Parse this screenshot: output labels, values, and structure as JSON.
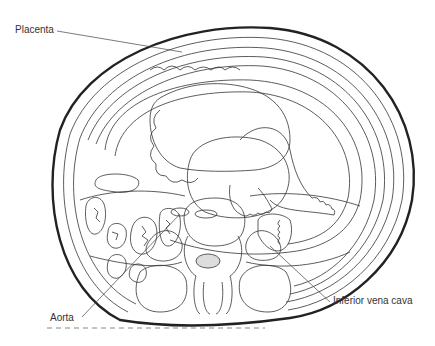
{
  "figure": {
    "labels": {
      "placenta": "Placenta",
      "aorta": "Aorta",
      "ivc": "Inferior vena cava"
    },
    "colors": {
      "line": "#333333",
      "outline": "#222222",
      "background": "#ffffff"
    }
  }
}
